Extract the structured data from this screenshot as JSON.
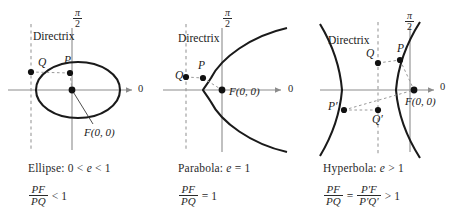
{
  "figure": {
    "background": "#ffffff",
    "curve_color": "#1a1a1a",
    "axis_color": "#8c8c8c",
    "dash_color": "#9a9a9a",
    "text_color": "#1a1a1a",
    "width": 460,
    "height": 222
  },
  "panels": [
    {
      "id": "ellipse",
      "conic": "Ellipse",
      "caption_prefix": "Ellipse:",
      "caption_condition_left": "0",
      "caption_rel1": "<",
      "caption_symbol": "e",
      "caption_rel2": "<",
      "caption_condition_right": "1",
      "ratio": {
        "numerator": "PF",
        "denominator": "PQ",
        "relation": "<",
        "value": "1"
      },
      "axis_label_polar": "0",
      "axis_label_pi_over_2_num": "π",
      "axis_label_pi_over_2_den": "2",
      "directrix_label": "Directrix",
      "points": [
        {
          "name": "Q",
          "label": "Q",
          "x": 31,
          "y": 72
        },
        {
          "name": "P",
          "label": "P",
          "x": 70,
          "y": 73
        },
        {
          "name": "F",
          "label": "F(0, 0)",
          "x": 72,
          "y": 90
        }
      ]
    },
    {
      "id": "parabola",
      "conic": "Parabola",
      "caption_prefix": "Parabola:",
      "caption_symbol": "e",
      "caption_rel1": "=",
      "caption_condition_right": "1",
      "ratio": {
        "numerator": "PF",
        "denominator": "PQ",
        "relation": "=",
        "value": "1"
      },
      "axis_label_polar": "0",
      "axis_label_pi_over_2_num": "π",
      "axis_label_pi_over_2_den": "2",
      "directrix_label": "Directrix",
      "points": [
        {
          "name": "Q",
          "label": "Q",
          "x": 186,
          "y": 77
        },
        {
          "name": "P",
          "label": "P",
          "x": 203,
          "y": 78
        },
        {
          "name": "F",
          "label": "F(0, 0)",
          "x": 222,
          "y": 90
        }
      ]
    },
    {
      "id": "hyperbola",
      "conic": "Hyperbola",
      "caption_prefix": "Hyperbola:",
      "caption_symbol": "e",
      "caption_rel1": ">",
      "caption_condition_right": "1",
      "ratio": {
        "numerator": "PF",
        "denominator": "PQ",
        "relation": "=",
        "numerator2": "P′F",
        "denominator2": "P′Q′",
        "relation2": ">",
        "value": "1"
      },
      "axis_label_polar": "0",
      "axis_label_pi_over_2_num": "π",
      "axis_label_pi_over_2_den": "2",
      "directrix_label": "Directrix",
      "points": [
        {
          "name": "Q",
          "label": "Q",
          "x": 378,
          "y": 63
        },
        {
          "name": "P",
          "label": "P",
          "x": 400,
          "y": 60
        },
        {
          "name": "F",
          "label": "F(0, 0)",
          "x": 414,
          "y": 90
        },
        {
          "name": "P-prime",
          "label": "P′",
          "x": 344,
          "y": 110
        },
        {
          "name": "Q-prime",
          "label": "Q′",
          "x": 378,
          "y": 110
        }
      ]
    }
  ]
}
